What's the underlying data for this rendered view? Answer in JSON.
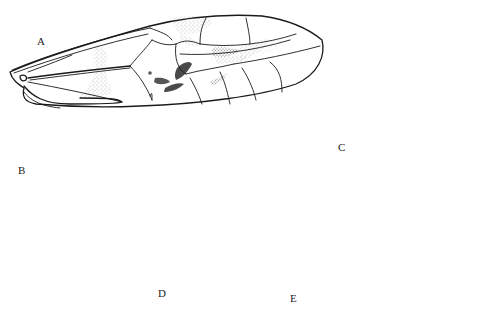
{
  "figure": {
    "type": "entomological illustration plate",
    "panels": [
      {
        "id": "A",
        "label": "A",
        "depicts": "forewing"
      },
      {
        "id": "B",
        "label": "B",
        "depicts": "hindwing"
      },
      {
        "id": "C",
        "label": "C",
        "depicts": "male terminalia, lateral view"
      },
      {
        "id": "D",
        "label": "D",
        "depicts": "female subgenital plate"
      },
      {
        "id": "E",
        "label": "E",
        "depicts": "spermatheca"
      }
    ],
    "colors": {
      "ink": "#1a1a1a",
      "stipple": "#8a8a8a",
      "dark_spot": "#4a4a4a",
      "background": "#ffffff"
    }
  }
}
